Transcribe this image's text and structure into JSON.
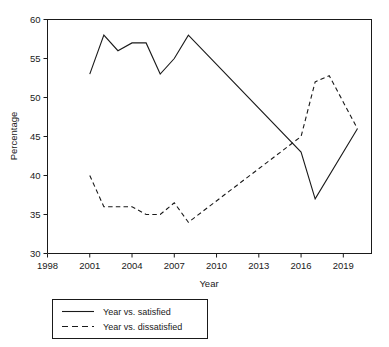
{
  "chart_data": {
    "type": "line",
    "title": "",
    "xlabel": "Year",
    "ylabel": "Percentage",
    "xlim": [
      1998,
      2021
    ],
    "ylim": [
      30,
      60
    ],
    "xticks": [
      1998,
      2001,
      2004,
      2007,
      2010,
      2013,
      2016,
      2019
    ],
    "yticks": [
      30,
      35,
      40,
      45,
      50,
      55,
      60
    ],
    "grid": false,
    "legend_position": "below-plot",
    "series": [
      {
        "name": "Year vs. satisfied",
        "style": "solid",
        "color": "#1a1a1a",
        "x": [
          2001,
          2002,
          2003,
          2004,
          2005,
          2006,
          2007,
          2008,
          2016,
          2017,
          2020
        ],
        "values": [
          53,
          58,
          56,
          57,
          57,
          53,
          55,
          58,
          43,
          37,
          46
        ]
      },
      {
        "name": "Year vs. dissatisfied",
        "style": "dashed",
        "color": "#1a1a1a",
        "x": [
          2001,
          2002,
          2003,
          2004,
          2005,
          2006,
          2007,
          2008,
          2016,
          2017,
          2018,
          2020
        ],
        "values": [
          40,
          36,
          36,
          36,
          35,
          35,
          36.5,
          34,
          45,
          52,
          52.8,
          46
        ]
      }
    ]
  },
  "axis": {
    "y_title": "Percentage",
    "x_title": "Year",
    "x_tick_labels": [
      "1998",
      "2001",
      "2004",
      "2007",
      "2010",
      "2013",
      "2016",
      "2019"
    ],
    "y_tick_labels": [
      "30",
      "35",
      "40",
      "45",
      "50",
      "55",
      "60"
    ]
  },
  "legend": {
    "entries": [
      {
        "label": "Year vs. satisfied",
        "style": "solid"
      },
      {
        "label": "Year vs. dissatisfied",
        "style": "dashed"
      }
    ]
  }
}
